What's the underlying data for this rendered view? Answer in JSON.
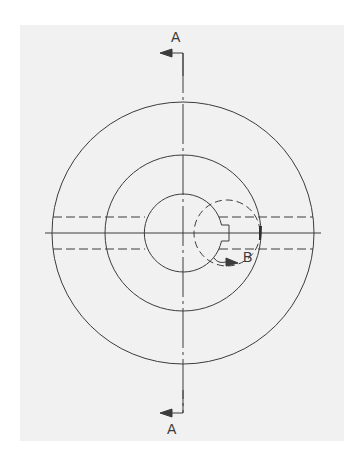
{
  "drawing": {
    "title": "Section view drawing of circular part with keyway",
    "colors": {
      "paper": "#f1f1f1",
      "line": "#3c3c3c",
      "background": "#ffffff"
    },
    "section_markers": {
      "top_label": "A",
      "bottom_label": "A"
    },
    "detail_marker": {
      "label": "B"
    },
    "geometry": {
      "center": [
        183,
        233
      ],
      "outer_circle_radius": 131,
      "middle_circle_radius": 78,
      "inner_circle_radius": 39,
      "hidden_lines_y": [
        217,
        249
      ],
      "detail_circle_center": [
        227,
        233
      ],
      "detail_circle_radius": 33
    }
  }
}
